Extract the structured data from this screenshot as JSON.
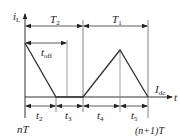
{
  "diagram": {
    "type": "inductor-current-waveform",
    "axes": {
      "y_label": "i",
      "y_label_sub": "L",
      "x_label": "t",
      "start_label": "nT",
      "end_label": "(n+1)T"
    },
    "periods": {
      "T2": {
        "main": "T",
        "sub": "2"
      },
      "T1": {
        "main": "T",
        "sub": "1"
      }
    },
    "toff": {
      "main": "t",
      "sub": "off"
    },
    "level": {
      "main": "I",
      "sub": "dc"
    },
    "intervals": [
      {
        "main": "t",
        "sub": "2"
      },
      {
        "main": "t",
        "sub": "3"
      },
      {
        "main": "t",
        "sub": "4"
      },
      {
        "main": "t",
        "sub": "5"
      }
    ],
    "colors": {
      "line": "#333333",
      "guide": "#888888"
    }
  }
}
